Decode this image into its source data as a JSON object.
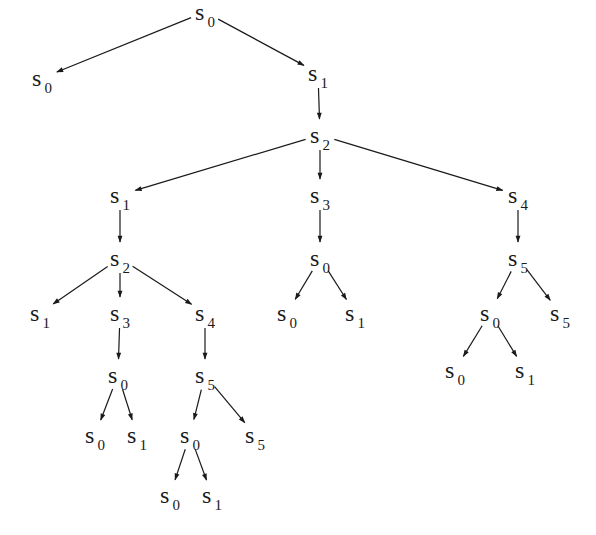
{
  "diagram": {
    "type": "tree",
    "nodes": [
      {
        "id": "n0",
        "label": "s",
        "sub": "0",
        "x": 205,
        "y": 12
      },
      {
        "id": "n1",
        "label": "s",
        "sub": "0",
        "x": 42,
        "y": 78
      },
      {
        "id": "n2",
        "label": "s",
        "sub": "1",
        "x": 318,
        "y": 73
      },
      {
        "id": "n3",
        "label": "s",
        "sub": "2",
        "x": 320,
        "y": 135
      },
      {
        "id": "n4",
        "label": "s",
        "sub": "1",
        "x": 120,
        "y": 195
      },
      {
        "id": "n5",
        "label": "s",
        "sub": "3",
        "x": 320,
        "y": 195
      },
      {
        "id": "n6",
        "label": "s",
        "sub": "4",
        "x": 518,
        "y": 195
      },
      {
        "id": "n7",
        "label": "s",
        "sub": "2",
        "x": 120,
        "y": 258
      },
      {
        "id": "n8",
        "label": "s",
        "sub": "0",
        "x": 320,
        "y": 258
      },
      {
        "id": "n9",
        "label": "s",
        "sub": "5",
        "x": 518,
        "y": 258
      },
      {
        "id": "n10",
        "label": "s",
        "sub": "1",
        "x": 40,
        "y": 313
      },
      {
        "id": "n11",
        "label": "s",
        "sub": "3",
        "x": 120,
        "y": 313
      },
      {
        "id": "n12",
        "label": "s",
        "sub": "4",
        "x": 205,
        "y": 313
      },
      {
        "id": "n13",
        "label": "s",
        "sub": "0",
        "x": 287,
        "y": 313
      },
      {
        "id": "n14",
        "label": "s",
        "sub": "1",
        "x": 355,
        "y": 313
      },
      {
        "id": "n15",
        "label": "s",
        "sub": "0",
        "x": 490,
        "y": 313
      },
      {
        "id": "n16",
        "label": "s",
        "sub": "5",
        "x": 560,
        "y": 313
      },
      {
        "id": "n17",
        "label": "s",
        "sub": "0",
        "x": 118,
        "y": 375
      },
      {
        "id": "n18",
        "label": "s",
        "sub": "5",
        "x": 205,
        "y": 375
      },
      {
        "id": "n19",
        "label": "s",
        "sub": "0",
        "x": 455,
        "y": 370
      },
      {
        "id": "n20",
        "label": "s",
        "sub": "1",
        "x": 525,
        "y": 370
      },
      {
        "id": "n21",
        "label": "s",
        "sub": "0",
        "x": 95,
        "y": 435
      },
      {
        "id": "n22",
        "label": "s",
        "sub": "1",
        "x": 137,
        "y": 435
      },
      {
        "id": "n23",
        "label": "s",
        "sub": "0",
        "x": 190,
        "y": 435
      },
      {
        "id": "n24",
        "label": "s",
        "sub": "5",
        "x": 255,
        "y": 435
      },
      {
        "id": "n25",
        "label": "s",
        "sub": "0",
        "x": 170,
        "y": 495
      },
      {
        "id": "n26",
        "label": "s",
        "sub": "1",
        "x": 212,
        "y": 495
      }
    ],
    "edges": [
      [
        "n0",
        "n1"
      ],
      [
        "n0",
        "n2"
      ],
      [
        "n2",
        "n3"
      ],
      [
        "n3",
        "n4"
      ],
      [
        "n3",
        "n5"
      ],
      [
        "n3",
        "n6"
      ],
      [
        "n4",
        "n7"
      ],
      [
        "n5",
        "n8"
      ],
      [
        "n6",
        "n9"
      ],
      [
        "n7",
        "n10"
      ],
      [
        "n7",
        "n11"
      ],
      [
        "n7",
        "n12"
      ],
      [
        "n8",
        "n13"
      ],
      [
        "n8",
        "n14"
      ],
      [
        "n9",
        "n15"
      ],
      [
        "n9",
        "n16"
      ],
      [
        "n11",
        "n17"
      ],
      [
        "n12",
        "n18"
      ],
      [
        "n15",
        "n19"
      ],
      [
        "n15",
        "n20"
      ],
      [
        "n17",
        "n21"
      ],
      [
        "n17",
        "n22"
      ],
      [
        "n18",
        "n23"
      ],
      [
        "n18",
        "n24"
      ],
      [
        "n23",
        "n25"
      ],
      [
        "n23",
        "n26"
      ]
    ],
    "colors": {
      "stroke": "#1a1a1a",
      "text": "#1a1a1a",
      "background": "#ffffff"
    }
  }
}
